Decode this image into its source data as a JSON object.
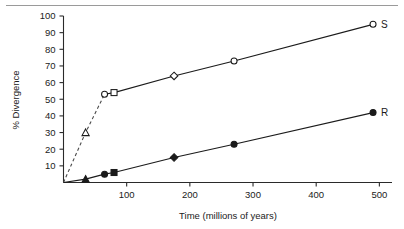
{
  "figure": {
    "background_color": "#ffffff",
    "rule_color": "#9a9a9a"
  },
  "chart_data": {
    "type": "line",
    "title": "",
    "xlabel": "Time (millions of years)",
    "ylabel": "% Divergence",
    "xlim": [
      0,
      520
    ],
    "ylim": [
      0,
      100
    ],
    "xticks": [
      100,
      200,
      300,
      400,
      500
    ],
    "xtick_labels": [
      "100",
      "200",
      "300",
      "400",
      "500"
    ],
    "yticks": [
      10,
      20,
      30,
      40,
      50,
      60,
      70,
      80,
      90,
      100
    ],
    "ytick_labels": [
      "10",
      "20",
      "30",
      "40",
      "50",
      "60",
      "70",
      "80",
      "90",
      "100"
    ],
    "grid": false,
    "legend_position": "right-inline-endpoint",
    "series": [
      {
        "name": "S",
        "label": "S",
        "marker_style": "open",
        "color": "#1b1b1b",
        "x": [
          0,
          35,
          65,
          80,
          175,
          270,
          490
        ],
        "y": [
          0,
          30,
          53,
          54,
          64,
          73,
          95
        ],
        "markers": [
          "none",
          "triangle",
          "circle",
          "square",
          "diamond",
          "circle",
          "circle"
        ],
        "dashed_segment_through_index": 2,
        "line_style_initial": "dashed",
        "line_style_main": "solid"
      },
      {
        "name": "R",
        "label": "R",
        "marker_style": "filled",
        "color": "#1b1b1b",
        "x": [
          0,
          35,
          65,
          80,
          175,
          270,
          490
        ],
        "y": [
          0,
          2,
          5,
          6,
          15,
          23,
          42
        ],
        "markers": [
          "none",
          "triangle",
          "circle",
          "square",
          "diamond",
          "circle",
          "circle"
        ],
        "line_style_main": "solid"
      }
    ]
  }
}
